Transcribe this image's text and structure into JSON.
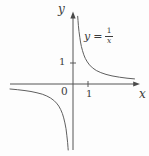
{
  "figure": {
    "background": "#fdfdfd",
    "line_color": "#5f5f5f",
    "axis_color": "#4a4a4a",
    "text_color": "#3c3c3c",
    "y_axis_label": "y",
    "x_axis_label": "x",
    "origin_label": "0",
    "x_tick_label": "1",
    "y_tick_label": "1",
    "equation": {
      "lhs": "y",
      "equals": "=",
      "numerator": "1",
      "denominator": "x"
    }
  },
  "chart_data": {
    "type": "line",
    "equation": "y = 1/x",
    "xlabel": "x",
    "ylabel": "y",
    "xlim": [
      -4.2,
      4.4
    ],
    "ylim": [
      -3.15,
      3.25
    ],
    "x_ticks": [
      {
        "value": 1,
        "label": "1"
      }
    ],
    "y_ticks": [
      {
        "value": 1,
        "label": "1"
      }
    ],
    "origin": {
      "label": "0",
      "value": 0
    },
    "grid": false,
    "legend": "none",
    "series": [
      {
        "name": "positive-branch",
        "points": [
          [
            0.31,
            3.226
          ],
          [
            0.33,
            3.03
          ],
          [
            0.36,
            2.778
          ],
          [
            0.4,
            2.5
          ],
          [
            0.45,
            2.222
          ],
          [
            0.5,
            2.0
          ],
          [
            0.56,
            1.786
          ],
          [
            0.63,
            1.587
          ],
          [
            0.72,
            1.389
          ],
          [
            0.82,
            1.22
          ],
          [
            0.95,
            1.053
          ],
          [
            1.1,
            0.909
          ],
          [
            1.3,
            0.769
          ],
          [
            1.55,
            0.645
          ],
          [
            1.85,
            0.541
          ],
          [
            2.2,
            0.455
          ],
          [
            2.6,
            0.385
          ],
          [
            3.1,
            0.323
          ],
          [
            3.6,
            0.278
          ],
          [
            4.1,
            0.244
          ]
        ]
      },
      {
        "name": "negative-branch",
        "points": [
          [
            -4.2,
            -0.238
          ],
          [
            -3.7,
            -0.27
          ],
          [
            -3.2,
            -0.313
          ],
          [
            -2.8,
            -0.357
          ],
          [
            -2.4,
            -0.417
          ],
          [
            -2.05,
            -0.488
          ],
          [
            -1.75,
            -0.571
          ],
          [
            -1.5,
            -0.667
          ],
          [
            -1.28,
            -0.781
          ],
          [
            -1.1,
            -0.909
          ],
          [
            -0.95,
            -1.053
          ],
          [
            -0.82,
            -1.22
          ],
          [
            -0.71,
            -1.408
          ],
          [
            -0.62,
            -1.613
          ],
          [
            -0.54,
            -1.852
          ],
          [
            -0.47,
            -2.128
          ],
          [
            -0.41,
            -2.439
          ],
          [
            -0.36,
            -2.778
          ],
          [
            -0.33,
            -3.03
          ],
          [
            -0.318,
            -3.145
          ]
        ]
      }
    ],
    "pixel_mapping": {
      "origin_x": 73,
      "origin_y": 84,
      "unit_px_x": 15,
      "unit_px_y": 21
    }
  }
}
